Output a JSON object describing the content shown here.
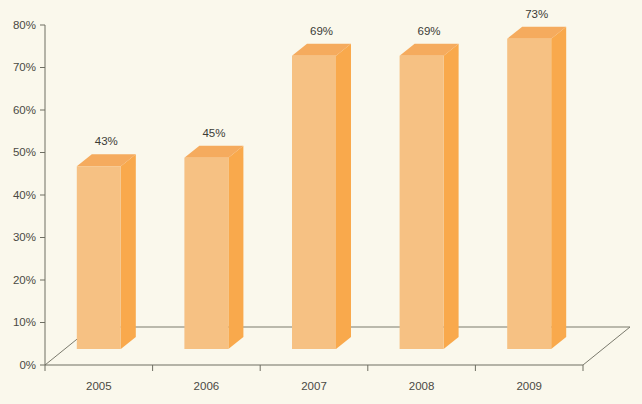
{
  "chart_data": {
    "type": "bar",
    "title": "",
    "subtitle": "",
    "xlabel": "",
    "ylabel": "",
    "categories": [
      "2005",
      "2006",
      "2007",
      "2008",
      "2009"
    ],
    "values": [
      43,
      45,
      69,
      69,
      73
    ],
    "value_labels": [
      "43%",
      "45%",
      "69%",
      "69%",
      "73%"
    ],
    "ylim": [
      0,
      80
    ],
    "ytick_values": [
      0,
      10,
      20,
      30,
      40,
      50,
      60,
      70,
      80
    ],
    "ytick_labels": [
      "0%",
      "10%",
      "20%",
      "30%",
      "40%",
      "50%",
      "60%",
      "70%",
      "80%"
    ],
    "grid": false,
    "legend": "none",
    "three_d": true,
    "colors": {
      "background": "#faf8ec",
      "bar_front": "#f6c183",
      "bar_top": "#f5ab5e",
      "bar_side": "#f9a94c",
      "axis": "#6e6e63",
      "text": "#4a4a44",
      "value_text": "#3b3b36"
    }
  }
}
